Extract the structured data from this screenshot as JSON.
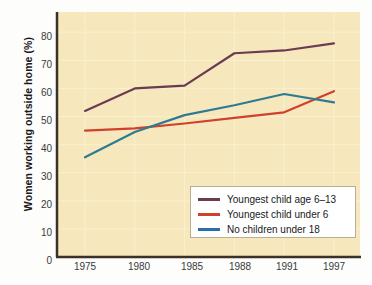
{
  "chart_data": {
    "type": "line",
    "title": "",
    "subtitle": "",
    "xlabel": "",
    "ylabel": "Women working outside home (%)",
    "categories": [
      "1975",
      "1980",
      "1985",
      "1988",
      "1991",
      "1997"
    ],
    "x_ticks": [
      "1975",
      "1980",
      "1985",
      "1988",
      "1991",
      "1997"
    ],
    "y_ticks": [
      "0",
      "10",
      "20",
      "30",
      "40",
      "50",
      "60",
      "70",
      "80"
    ],
    "ylim": [
      0,
      85
    ],
    "grid": true,
    "legend_position": "bottom-right",
    "series": [
      {
        "name": "Youngest child age 6–13",
        "color": "#6b3b52",
        "values": [
          52,
          60,
          61,
          72.5,
          73.5,
          76
        ]
      },
      {
        "name": "Youngest child under 6",
        "color": "#d1402c",
        "values": [
          45,
          45.8,
          47.5,
          49.5,
          51.5,
          59
        ]
      },
      {
        "name": "No children under 18",
        "color": "#2e7b91",
        "values": [
          35.5,
          44.5,
          50.5,
          54,
          58,
          55
        ]
      }
    ],
    "plot_background": "#f6e8bc",
    "page_background": "#fdfdfb",
    "axis_color": "#3a3226"
  },
  "legend": {
    "items": [
      {
        "label": "Youngest child age 6–13",
        "color": "#6b3b52"
      },
      {
        "label": "Youngest child under 6",
        "color": "#d1402c"
      },
      {
        "label": "No children under 18",
        "color": "#2c6fa8"
      }
    ]
  }
}
